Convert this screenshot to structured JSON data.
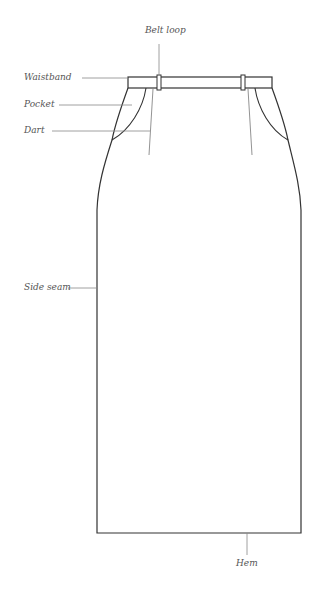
{
  "diagram": {
    "line_color": "#333333",
    "callout_color": "#777777",
    "labels": {
      "belt_loop": "Belt loop",
      "waistband": "Waistband",
      "pocket": "Pocket",
      "dart": "Dart",
      "side_seam": "Side seam",
      "hem": "Hem"
    }
  }
}
